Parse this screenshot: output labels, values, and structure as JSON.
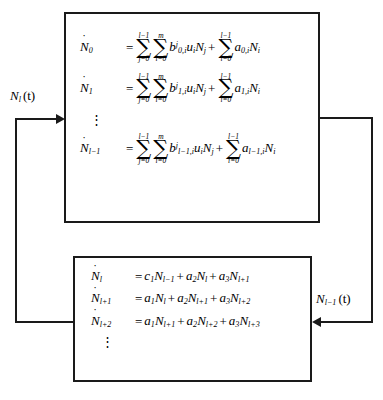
{
  "diagram": {
    "line_color": "#1a1a1a",
    "background": "#ffffff"
  },
  "top_block": {
    "name": "upper-equation-block",
    "equations": [
      {
        "id": "eq-n0",
        "lhs_var": "N",
        "lhs_sub": "0",
        "equals": "=",
        "sum1": {
          "upper": "l−1",
          "lower": "j=0"
        },
        "sum2": {
          "upper": "m",
          "lower": "i=0"
        },
        "term1_coef": "b",
        "term1_sub": "0,i",
        "term1_sup": "j",
        "term1_vars": "u",
        "term1_vars_sub": "i",
        "term1_var2": "N",
        "term1_var2_sub": "j",
        "plus": "+",
        "sum3": {
          "upper": "l−1",
          "lower": "i=0"
        },
        "term2_coef": "a",
        "term2_sub": "0,i",
        "term2_var": "N",
        "term2_var_sub": "i",
        "plain": "Ṅ₀ = Σ(j=0..l−1) Σ(i=0..m) b₀,ⁱʲ uᵢ N_j + Σ(i=0..l−1) a₀,ᵢ Nᵢ"
      },
      {
        "id": "eq-n1",
        "lhs_var": "N",
        "lhs_sub": "1",
        "equals": "=",
        "sum1": {
          "upper": "l−1",
          "lower": "j=0"
        },
        "sum2": {
          "upper": "m",
          "lower": "i=0"
        },
        "term1_coef": "b",
        "term1_sub": "1,i",
        "term1_sup": "j",
        "term1_vars": "u",
        "term1_vars_sub": "i",
        "term1_var2": "N",
        "term1_var2_sub": "j",
        "plus": "+",
        "sum3": {
          "upper": "l−1",
          "lower": "i=0"
        },
        "term2_coef": "a",
        "term2_sub": "1,i",
        "term2_var": "N",
        "term2_var_sub": "i",
        "plain": "Ṅ₁ = Σ(j=0..l−1) Σ(i=0..m) b₁,ᵢʲ uᵢ N_j + Σ(i=0..l−1) a₁,ᵢ Nᵢ"
      },
      {
        "id": "eq-nlm1",
        "lhs_var": "N",
        "lhs_sub": "l−1",
        "equals": "=",
        "sum1": {
          "upper": "l−1",
          "lower": "j=0"
        },
        "sum2": {
          "upper": "m",
          "lower": "i=0"
        },
        "term1_coef": "b",
        "term1_sub": "l−1,i",
        "term1_sup": "j",
        "term1_vars": "u",
        "term1_vars_sub": "i",
        "term1_var2": "N",
        "term1_var2_sub": "j",
        "plus": "+",
        "sum3": {
          "upper": "l−1",
          "lower": "i=0"
        },
        "term2_coef": "a",
        "term2_sub": "l−1,i",
        "term2_var": "N",
        "term2_var_sub": "i",
        "plain": "Ṅ_{l−1} = Σ(j=0..l−1) Σ(i=0..m) b_{l−1,i}ʲ uᵢ N_j + Σ(i=0..l−1) a_{l−1,i} Nᵢ"
      }
    ],
    "vdots": "⋮"
  },
  "bottom_block": {
    "name": "lower-equation-block",
    "equations": [
      {
        "id": "eq-nl",
        "lhs_var": "N",
        "lhs_sub": "l",
        "equals": "=",
        "t1_coef": "c",
        "t1_coef_sub": "1",
        "t1_var": "N",
        "t1_var_sub": "l−1",
        "op1": "+",
        "t2_coef": "a",
        "t2_coef_sub": "2",
        "t2_var": "N",
        "t2_var_sub": "l",
        "op2": "+",
        "t3_coef": "a",
        "t3_coef_sub": "3",
        "t3_var": "N",
        "t3_var_sub": "l+1",
        "plain": "Ṅ_l = c₁N_{l−1} + a₂N_l + a₃N_{l+1}"
      },
      {
        "id": "eq-nlp1",
        "lhs_var": "N",
        "lhs_sub": "l+1",
        "equals": "=",
        "t1_coef": "a",
        "t1_coef_sub": "1",
        "t1_var": "N",
        "t1_var_sub": "l",
        "op1": "+",
        "t2_coef": "a",
        "t2_coef_sub": "2",
        "t2_var": "N",
        "t2_var_sub": "l+1",
        "op2": "+",
        "t3_coef": "a",
        "t3_coef_sub": "3",
        "t3_var": "N",
        "t3_var_sub": "l+2",
        "plain": "Ṅ_{l+1} = a₁N_l + a₂N_{l+1} + a₃N_{l+2}"
      },
      {
        "id": "eq-nlp2",
        "lhs_var": "N",
        "lhs_sub": "l+2",
        "equals": "=",
        "t1_coef": "a",
        "t1_coef_sub": "1",
        "t1_var": "N",
        "t1_var_sub": "l+1",
        "op1": "+",
        "t2_coef": "a",
        "t2_coef_sub": "2",
        "t2_var": "N",
        "t2_var_sub": "l+2",
        "op2": "+",
        "t3_coef": "a",
        "t3_coef_sub": "3",
        "t3_var": "N",
        "t3_var_sub": "l+3",
        "plain": "Ṅ_{l+2} = a₁N_{l+1} + a₂N_{l+2} + a₃N_{l+3}"
      }
    ],
    "vdots": "⋮"
  },
  "signals": {
    "left": {
      "name": "feedback-signal-left",
      "var": "N",
      "sub": "l",
      "arg": "(t)",
      "plain": "N_l(t)",
      "direction": "bottom-block-to-top-block"
    },
    "right": {
      "name": "feedback-signal-right",
      "var": "N",
      "sub": "l−1",
      "arg": "(t)",
      "plain": "N_{l−1}(t)",
      "direction": "top-block-to-bottom-block"
    }
  }
}
